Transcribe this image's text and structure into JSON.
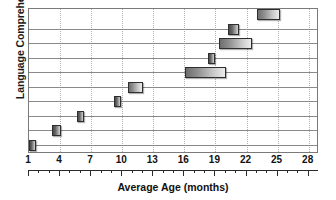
{
  "chart_data": {
    "type": "bar",
    "orientation": "horizontal",
    "title": "",
    "xlabel": "Average Age (months)",
    "ylabel": "Language Comprehension",
    "xlim": [
      1,
      29
    ],
    "xticks": [
      1,
      4,
      7,
      10,
      13,
      16,
      19,
      22,
      25,
      28
    ],
    "xtick_labels": [
      "1",
      "4",
      "7",
      "10",
      "13",
      "16",
      "19",
      "22",
      "25",
      "28"
    ],
    "minor_tick_step": 1,
    "grid": "vertical dotted gridlines at major ticks; horizontal row separator lines",
    "legend": "none",
    "categories": [
      "milestone-10",
      "milestone-9",
      "milestone-8",
      "milestone-7",
      "milestone-6",
      "milestone-5",
      "milestone-4",
      "milestone-3",
      "milestone-2",
      "milestone-1"
    ],
    "bars": [
      {
        "row": 0,
        "start": 23.0,
        "end": 25.2,
        "span": 2.2
      },
      {
        "row": 1,
        "start": 20.2,
        "end": 21.3,
        "span": 1.1
      },
      {
        "row": 2,
        "start": 19.3,
        "end": 22.5,
        "span": 3.2
      },
      {
        "row": 3,
        "start": 18.3,
        "end": 18.9,
        "span": 0.6
      },
      {
        "row": 4,
        "start": 16.1,
        "end": 20.0,
        "span": 3.9
      },
      {
        "row": 5,
        "start": 10.6,
        "end": 12.0,
        "span": 1.4
      },
      {
        "row": 6,
        "start": 9.2,
        "end": 9.9,
        "span": 0.7
      },
      {
        "row": 7,
        "start": 5.6,
        "end": 6.1,
        "span": 0.5
      },
      {
        "row": 8,
        "start": 3.2,
        "end": 4.1,
        "span": 0.9
      },
      {
        "row": 9,
        "start": 1.0,
        "end": 1.7,
        "span": 0.7
      }
    ],
    "row_lines_y_fraction": [
      0.135,
      0.235,
      0.335,
      0.435,
      0.535,
      0.635,
      0.735,
      0.835,
      0.935
    ],
    "colors": {
      "bar_fill_dark": "#6e6e6e",
      "bar_fill_light": "#ececec",
      "bar_border": "#2e2e2e",
      "gridline": "#b0b0b0",
      "rowline": "#8a8a8a",
      "frame": "#7a7a7a",
      "text": "#111111",
      "background": "#ffffff"
    }
  }
}
